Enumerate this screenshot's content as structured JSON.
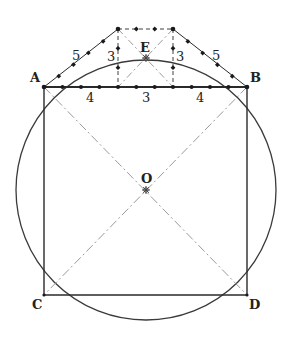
{
  "diagram": {
    "colors": {
      "line": "#2a2a2a",
      "dash": "#9a9a9a",
      "background": "#ffffff"
    },
    "points": {
      "A": {
        "label": "A",
        "x": 44,
        "y": 87
      },
      "B": {
        "label": "B",
        "x": 247,
        "y": 87
      },
      "C": {
        "label": "C",
        "x": 44,
        "y": 295
      },
      "D": {
        "label": "D",
        "x": 247,
        "y": 295
      },
      "E": {
        "label": "E",
        "x": 146,
        "y": 58
      },
      "O": {
        "label": "O",
        "x": 146,
        "y": 190
      },
      "P": {
        "label": "",
        "x": 118,
        "y": 29
      },
      "Q": {
        "label": "",
        "x": 173,
        "y": 29
      }
    },
    "circle": {
      "cx": 146,
      "cy": 190,
      "r": 130
    },
    "segment_labels": {
      "ab_left": "4",
      "ab_middle": "3",
      "ab_right": "4",
      "slant_left": "5",
      "slant_right": "5",
      "vertical_left": "3",
      "vertical_right": "3"
    }
  }
}
